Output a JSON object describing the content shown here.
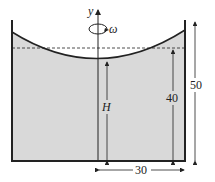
{
  "diagram": {
    "type": "rotating-cylinder-fluid",
    "axis_label": "y",
    "rotation_label": "ω",
    "height_label": "H",
    "dimensions": {
      "initial_fluid_height": "40",
      "container_height": "50",
      "radius": "30"
    },
    "colors": {
      "fluid": "#d9d9d9",
      "lines": "#222222",
      "background": "#ffffff"
    }
  }
}
